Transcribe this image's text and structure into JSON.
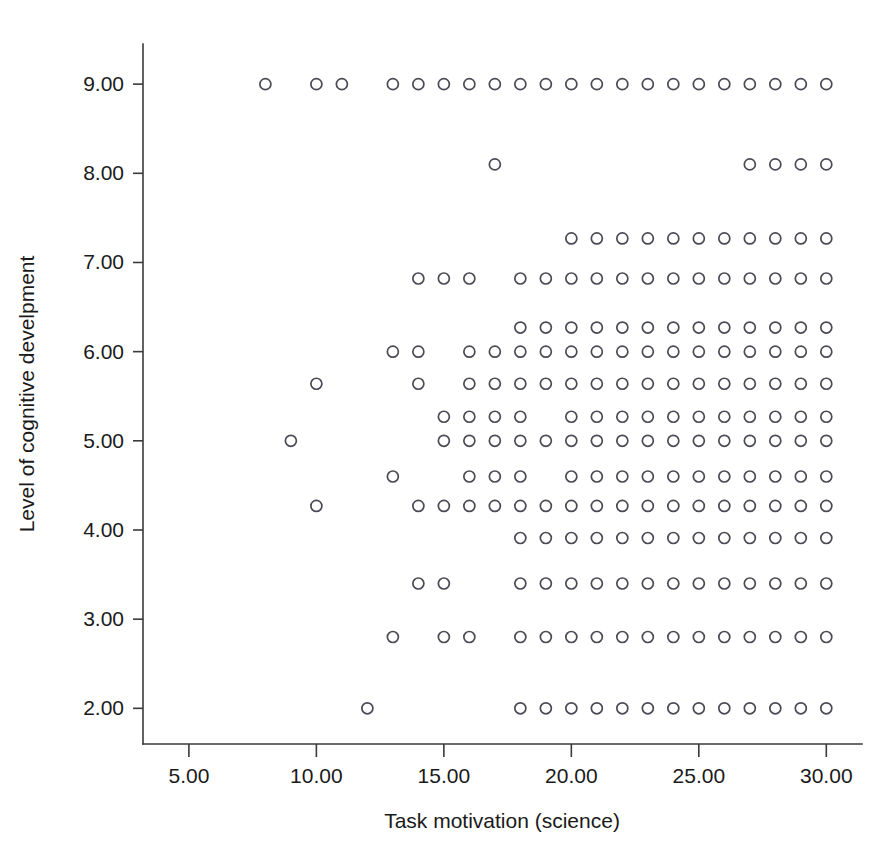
{
  "chart_data": {
    "type": "scatter",
    "title": "",
    "subtitle": "",
    "xlabel": "Task motivation (science)",
    "ylabel": "Level of cognitive develpment",
    "xlim": [
      3.2,
      31.4
    ],
    "ylim": [
      1.6,
      9.45
    ],
    "grid": false,
    "legend": null,
    "xticks": [
      5,
      10,
      15,
      20,
      25,
      30
    ],
    "xticklabels": [
      "5.00",
      "10.00",
      "15.00",
      "20.00",
      "25.00",
      "30.00"
    ],
    "yticks": [
      2,
      3,
      4,
      5,
      6,
      7,
      8,
      9
    ],
    "yticklabels": [
      "2.00",
      "3.00",
      "4.00",
      "5.00",
      "6.00",
      "7.00",
      "8.00",
      "9.00"
    ],
    "marker": "open-circle",
    "marker_color": "#4a4a55",
    "marker_size": 11,
    "rows": [
      {
        "y": 9.0,
        "x": [
          8,
          10,
          11,
          13,
          14,
          15,
          16,
          17,
          18,
          19,
          20,
          21,
          22,
          23,
          24,
          25,
          26,
          27,
          28,
          29,
          30
        ]
      },
      {
        "y": 8.1,
        "x": [
          17,
          27,
          28,
          29,
          30
        ]
      },
      {
        "y": 7.27,
        "x": [
          20,
          21,
          22,
          23,
          24,
          25,
          26,
          27,
          28,
          29,
          30
        ]
      },
      {
        "y": 6.82,
        "x": [
          14,
          15,
          16,
          18,
          19,
          20,
          21,
          22,
          23,
          24,
          25,
          26,
          27,
          28,
          29,
          30
        ]
      },
      {
        "y": 6.27,
        "x": [
          18,
          19,
          20,
          21,
          22,
          23,
          24,
          25,
          26,
          27,
          28,
          29,
          30
        ]
      },
      {
        "y": 6.0,
        "x": [
          13,
          14,
          16,
          17,
          18,
          19,
          20,
          21,
          22,
          23,
          24,
          25,
          26,
          27,
          28,
          29,
          30
        ]
      },
      {
        "y": 5.64,
        "x": [
          10,
          14,
          16,
          17,
          18,
          19,
          20,
          21,
          22,
          23,
          24,
          25,
          26,
          27,
          28,
          29,
          30
        ]
      },
      {
        "y": 5.27,
        "x": [
          15,
          16,
          17,
          18,
          20,
          21,
          22,
          23,
          24,
          25,
          26,
          27,
          28,
          29,
          30
        ]
      },
      {
        "y": 5.0,
        "x": [
          9,
          15,
          16,
          17,
          18,
          19,
          20,
          21,
          22,
          23,
          24,
          25,
          26,
          27,
          28,
          29,
          30
        ]
      },
      {
        "y": 4.6,
        "x": [
          13,
          16,
          17,
          18,
          20,
          21,
          22,
          23,
          24,
          25,
          26,
          27,
          28,
          29,
          30
        ]
      },
      {
        "y": 4.27,
        "x": [
          10,
          14,
          15,
          16,
          17,
          18,
          19,
          20,
          21,
          22,
          23,
          24,
          25,
          26,
          27,
          28,
          29,
          30
        ]
      },
      {
        "y": 3.91,
        "x": [
          18,
          19,
          20,
          21,
          22,
          23,
          24,
          25,
          26,
          27,
          28,
          29,
          30
        ]
      },
      {
        "y": 3.4,
        "x": [
          14,
          15,
          18,
          19,
          20,
          21,
          22,
          23,
          24,
          25,
          26,
          27,
          28,
          29,
          30
        ]
      },
      {
        "y": 2.8,
        "x": [
          13,
          15,
          16,
          18,
          19,
          20,
          21,
          22,
          23,
          24,
          25,
          26,
          27,
          28,
          29,
          30
        ]
      },
      {
        "y": 2.0,
        "x": [
          12,
          18,
          19,
          20,
          21,
          22,
          23,
          24,
          25,
          26,
          27,
          28,
          29,
          30
        ]
      }
    ]
  }
}
